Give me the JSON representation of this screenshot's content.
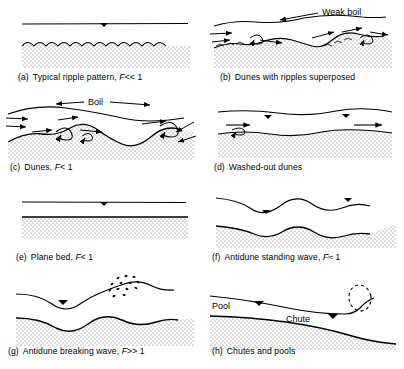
{
  "figure": {
    "bed_fill_color": "#f2f2f2",
    "line_color": "#000000"
  },
  "panels": [
    {
      "id": "a",
      "tag": "(a)",
      "caption_text": "Typical ripple pattern,",
      "froude_symbol": "F",
      "froude_relation": "<< 1",
      "bedform": "ripples",
      "water_surface": "flat",
      "annotations": []
    },
    {
      "id": "b",
      "tag": "(b)",
      "caption_text": "Dunes with ripples superposed",
      "froude_symbol": "",
      "froude_relation": "",
      "bedform": "dunes-with-ripples",
      "water_surface": "gently-undulating",
      "annotations": [
        {
          "name": "weak-boil-label",
          "text": "Weak boil"
        }
      ]
    },
    {
      "id": "c",
      "tag": "(c)",
      "caption_text": "Dunes,",
      "froude_symbol": "F",
      "froude_relation": "< 1",
      "bedform": "dunes",
      "water_surface": "out-of-phase-undulating",
      "annotations": [
        {
          "name": "boil-label",
          "text": "Boil"
        }
      ]
    },
    {
      "id": "d",
      "tag": "(d)",
      "caption_text": "Washed-out dunes",
      "froude_symbol": "",
      "froude_relation": "",
      "bedform": "washed-out-dunes",
      "water_surface": "slightly-undulating",
      "annotations": []
    },
    {
      "id": "e",
      "tag": "(e)",
      "caption_text": "Plane bed,",
      "froude_symbol": "F",
      "froude_relation": "< 1",
      "bedform": "plane-bed",
      "water_surface": "flat",
      "annotations": []
    },
    {
      "id": "f",
      "tag": "(f)",
      "caption_text": "Antidune standing wave,",
      "froude_symbol": "F",
      "froude_relation": "≈ 1",
      "bedform": "antidunes",
      "water_surface": "in-phase-standing-wave",
      "annotations": []
    },
    {
      "id": "g",
      "tag": "(g)",
      "caption_text": "Antidune breaking wave,",
      "froude_symbol": "F",
      "froude_relation": ">> 1",
      "bedform": "antidunes",
      "water_surface": "breaking-wave",
      "annotations": [
        {
          "name": "wave-spray",
          "text": ""
        }
      ]
    },
    {
      "id": "h",
      "tag": "(h)",
      "caption_text": "Chutes and pools",
      "froude_symbol": "",
      "froude_relation": "",
      "bedform": "chutes-and-pools",
      "water_surface": "hydraulic-jump",
      "annotations": [
        {
          "name": "pool-label",
          "text": "Pool"
        },
        {
          "name": "chute-label",
          "text": "Chute"
        }
      ]
    }
  ]
}
